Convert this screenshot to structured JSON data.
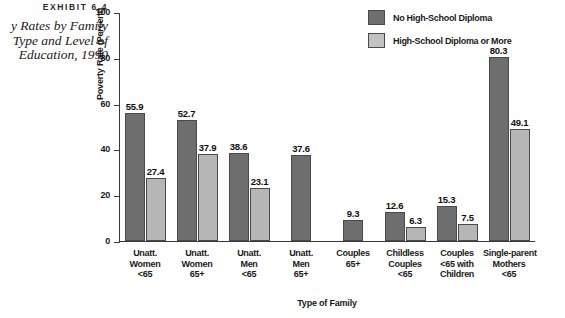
{
  "exhibit": {
    "label": "EXHIBIT 6.4",
    "title_lines": [
      "y Rates by Family",
      "Type and Level of",
      "Education, 1990"
    ]
  },
  "legend": {
    "position": "top-right",
    "items": [
      {
        "label": "No High-School Diploma",
        "color": "#6e6e6e",
        "swatch": "dark"
      },
      {
        "label": "High-School Diploma or More",
        "color": "#c2c2c2",
        "swatch": "light"
      }
    ]
  },
  "chart_data": {
    "type": "bar",
    "title": "",
    "xlabel": "Type of Family",
    "ylabel": "Poverty Rate (Percent)",
    "ylim": [
      0,
      100
    ],
    "yticks": [
      0,
      20,
      40,
      60,
      80,
      100
    ],
    "ytick_labels": [
      "0",
      "20",
      "40",
      "60",
      "80",
      "100"
    ],
    "grid": false,
    "categories": [
      [
        "Unatt.",
        "Women",
        "<65"
      ],
      [
        "Unatt.",
        "Women",
        "65+"
      ],
      [
        "Unatt.",
        "Men",
        "<65"
      ],
      [
        "Unatt.",
        "Men",
        "65+"
      ],
      [
        "Couples",
        "65+"
      ],
      [
        "Childless",
        "Couples",
        "<65"
      ],
      [
        "Couples",
        "<65 with",
        "Children"
      ],
      [
        "Single-parent",
        "Mothers",
        "<65"
      ]
    ],
    "series": [
      {
        "name": "No High-School Diploma",
        "color": "#6e6e6e",
        "values": [
          55.9,
          52.7,
          38.6,
          37.6,
          9.3,
          12.6,
          15.3,
          80.3
        ]
      },
      {
        "name": "High-School Diploma or More",
        "color": "#b6b6b6",
        "values": [
          27.4,
          37.9,
          23.1,
          null,
          null,
          6.3,
          7.5,
          49.1
        ]
      }
    ]
  }
}
